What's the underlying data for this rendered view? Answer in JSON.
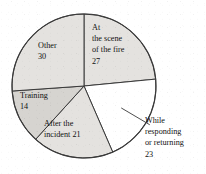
{
  "chart_data": {
    "type": "pie",
    "title": "",
    "subtitle": "",
    "xlabel": "",
    "ylabel": "",
    "legend_position": "none",
    "grid": false,
    "total": 115,
    "units": "",
    "categories": [
      "At the scene of the fire",
      "While responding or returning",
      "After the incident",
      "Training",
      "Other"
    ],
    "values": [
      27,
      23,
      21,
      14,
      30
    ],
    "slices": [
      {
        "name": "at-the-scene-of-the-fire",
        "label_lines": [
          "At",
          "the scene",
          "of the fire",
          "27"
        ],
        "value": 27,
        "start_angle": 0,
        "end_angle": 84.5,
        "fill": "#e4e2df",
        "label_placement": "inside",
        "label_x": 92,
        "label_y": 30
      },
      {
        "name": "while-responding-or-returning",
        "label_lines": [
          "While",
          "responding",
          "or returning",
          "23"
        ],
        "value": 23,
        "start_angle": 84.5,
        "end_angle": 156.5,
        "fill": "#ffffff",
        "label_placement": "outside",
        "label_x": 145,
        "label_y": 123
      },
      {
        "name": "after-the-incident",
        "label_lines": [
          "After the",
          "incident 21"
        ],
        "value": 21,
        "start_angle": 156.5,
        "end_angle": 222.2,
        "fill": "#e4e2df",
        "label_placement": "inside",
        "label_x": 44,
        "label_y": 126
      },
      {
        "name": "training",
        "label_lines": [
          "Training",
          "14"
        ],
        "value": 14,
        "start_angle": 222.2,
        "end_angle": 266.0,
        "fill": "#d6d4d0",
        "label_placement": "inside",
        "label_x": 20,
        "label_y": 98
      },
      {
        "name": "other",
        "label_lines": [
          "Other",
          "30"
        ],
        "value": 30,
        "start_angle": 266.0,
        "end_angle": 360,
        "fill": "#e4e2df",
        "label_placement": "inside",
        "label_x": 38,
        "label_y": 48
      }
    ],
    "geometry": {
      "center_x": 84,
      "center_y": 86,
      "radius": 72
    },
    "colors": {
      "outline": "#3a3a3a",
      "shaded": "#e4e2df",
      "shaded_dark": "#d6d4d0",
      "unshaded": "#ffffff",
      "text": "#111111"
    }
  }
}
